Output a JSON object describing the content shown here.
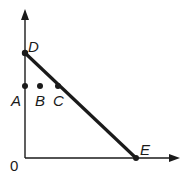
{
  "diagram": {
    "origin_label": "0",
    "points": [
      {
        "id": "D",
        "label": "D",
        "x": 25,
        "y": 53,
        "lx": 30,
        "ly": 51
      },
      {
        "id": "A",
        "label": "A",
        "x": 25,
        "y": 86,
        "lx": 11,
        "ly": 106
      },
      {
        "id": "B",
        "label": "B",
        "x": 40,
        "y": 86,
        "lx": 35,
        "ly": 106
      },
      {
        "id": "C",
        "label": "C",
        "x": 58,
        "y": 86,
        "lx": 53,
        "ly": 106
      },
      {
        "id": "E",
        "label": "E",
        "x": 136,
        "y": 158,
        "lx": 140,
        "ly": 155
      }
    ],
    "segment": {
      "from": "D",
      "to": "E"
    },
    "colors": {
      "ink": "#1a1a1a",
      "background": "#ffffff"
    }
  }
}
